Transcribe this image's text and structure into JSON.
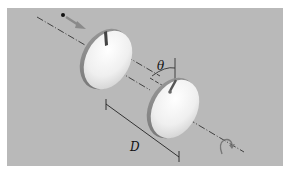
{
  "figure": {
    "labels": {
      "angle": "θ",
      "distance": "D"
    },
    "colors": {
      "background": "#b9b9b9",
      "disk": "#f2f2f2",
      "disk_shadow": "#a8a8a8",
      "axis_line": "#333333",
      "arrow": "#8a8a8a"
    }
  }
}
